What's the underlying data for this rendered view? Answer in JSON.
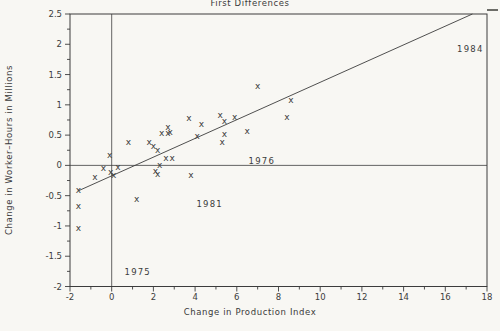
{
  "chart_data": {
    "type": "scatter",
    "title": "First Differences",
    "xlabel": "Change in Production Index",
    "ylabel": "Change in Worker–Hours in Millions",
    "xlim": [
      -2,
      18
    ],
    "ylim": [
      -2,
      2.5
    ],
    "x_major_tick_step": 2,
    "x_minor_tick_step": 1,
    "y_major_tick_step": 0.5,
    "y_minor_tick_step": 0.25,
    "x_tick_labels": [
      "-2",
      "0",
      "2",
      "4",
      "6",
      "8",
      "10",
      "12",
      "14",
      "16",
      "18"
    ],
    "y_tick_labels": [
      "-2",
      "-1.5",
      "-1",
      "-0.5",
      "0",
      "0.5",
      "1",
      "1.5",
      "2",
      "2.5"
    ],
    "grid": false,
    "legend": "none",
    "marker_glyph": "x",
    "points": [
      [
        -1.6,
        -0.4
      ],
      [
        -1.6,
        -0.67
      ],
      [
        -1.6,
        -1.04
      ],
      [
        -0.8,
        -0.19
      ],
      [
        -0.4,
        -0.04
      ],
      [
        -0.1,
        0.18
      ],
      [
        -0.05,
        -0.1
      ],
      [
        0.1,
        -0.16
      ],
      [
        0.3,
        -0.03
      ],
      [
        0.8,
        0.39
      ],
      [
        1.2,
        -0.55
      ],
      [
        1.8,
        0.38
      ],
      [
        2.0,
        0.33
      ],
      [
        2.2,
        0.25
      ],
      [
        2.3,
        0.01
      ],
      [
        2.1,
        -0.09
      ],
      [
        2.2,
        -0.14
      ],
      [
        2.6,
        0.12
      ],
      [
        2.9,
        0.12
      ],
      [
        2.4,
        0.54
      ],
      [
        2.7,
        0.64
      ],
      [
        2.7,
        0.53
      ],
      [
        2.8,
        0.55
      ],
      [
        3.7,
        0.78
      ],
      [
        3.8,
        -0.16
      ],
      [
        4.1,
        0.49
      ],
      [
        4.3,
        0.69
      ],
      [
        5.2,
        0.84
      ],
      [
        5.4,
        0.74
      ],
      [
        5.9,
        0.8
      ],
      [
        5.4,
        0.52
      ],
      [
        5.3,
        0.38
      ],
      [
        6.5,
        0.57
      ],
      [
        7.0,
        1.32
      ],
      [
        8.4,
        0.8
      ],
      [
        8.6,
        1.08
      ]
    ],
    "regression_line": {
      "x1": -1.6,
      "y1": -0.42,
      "x2": 17.3,
      "y2": 2.5
    },
    "reference_lines": {
      "vertical_x": 0,
      "horizontal_y": 0
    },
    "annotations": [
      {
        "label": "1984",
        "x": 17.2,
        "y": 1.93
      },
      {
        "label": "1976",
        "x": 7.2,
        "y": 0.07
      },
      {
        "label": "1981",
        "x": 4.7,
        "y": -0.63
      },
      {
        "label": "1975",
        "x": 1.25,
        "y": -1.76
      }
    ],
    "colors": {
      "ink": "#3c3c3c",
      "background": "#f8f7f3"
    }
  }
}
